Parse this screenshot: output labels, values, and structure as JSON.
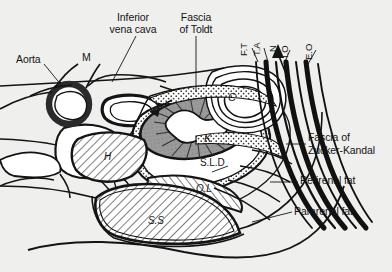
{
  "figure": {
    "type": "anatomical-cross-section",
    "region": "retroperitoneum / kidney axial section",
    "background_color": "#efefed",
    "ink_color": "#141414"
  },
  "labels": {
    "aorta": "Aorta",
    "m": "M",
    "inferior_vena_cava_line1": "Inferior",
    "inferior_vena_cava_line2": "vena cava",
    "fascia_of_toldt_line1": "Fascia",
    "fascia_of_toldt_line2": "of Toldt",
    "ft": "F.T",
    "ta": "T.A",
    "n": "N",
    "io": "I.O",
    "eo": "E.O",
    "fascia_zucker_line1": "Fascia of",
    "fascia_zucker_line2": "Zucker-Kandal",
    "perirenal_fat": "Perirenal fat",
    "pararenal_fat": "Pararenal fat",
    "sld": "S.L.D",
    "c": "C",
    "k": "K",
    "h": "H",
    "ql": "Q.L",
    "ss": "S.S"
  },
  "colors": {
    "ink": "#141414",
    "kidney_fill": "#9a9a9a",
    "kidney_inner": "#ffffff",
    "muscle_band": "#111111",
    "fat_stipple": "#6a6a6a",
    "white_fill": "#ffffff",
    "page": "#efefed"
  }
}
